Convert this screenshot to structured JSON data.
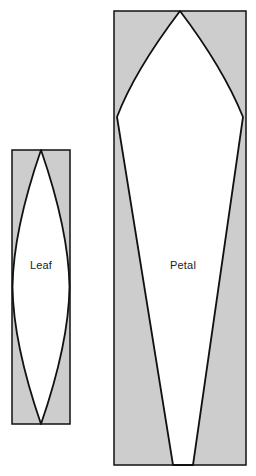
{
  "diagram": {
    "canvas": {
      "width": 256,
      "height": 476,
      "background": "#ffffff"
    },
    "style": {
      "panel_fill": "#cdcdcd",
      "shape_fill": "#ffffff",
      "outline_color": "#111111",
      "panel_stroke_width": 1.5,
      "shape_stroke_width": 1.8,
      "label_color": "#1a1a1a",
      "label_font_size": 11
    },
    "shapes": [
      {
        "id": "leaf",
        "label": "Leaf",
        "label_x": 41,
        "label_y": 266,
        "panel": {
          "x": 12,
          "y": 150,
          "width": 58,
          "height": 274
        },
        "outline_path": "M 41 150 C 21 208 13 250 12.5 287 C 13 324 21 366 41 424 C 61 366 69 324 69.5 287 C 69 250 61 208 41 150 Z",
        "description": "pointed-oval lens shape touching top, bottom and both sides of its panel"
      },
      {
        "id": "petal",
        "label": "Petal",
        "label_x": 183,
        "label_y": 266,
        "panel": {
          "x": 114,
          "y": 11,
          "width": 132,
          "height": 454
        },
        "outline_path": "M 180 11 C 158 40 131 80 117 117 L 173 465 L 193 465 L 243 117 C 228 80 202 40 180 11 Z",
        "description": "tall petal with curved shoulders widening near the top then tapering straight to the bottom edge"
      }
    ]
  }
}
